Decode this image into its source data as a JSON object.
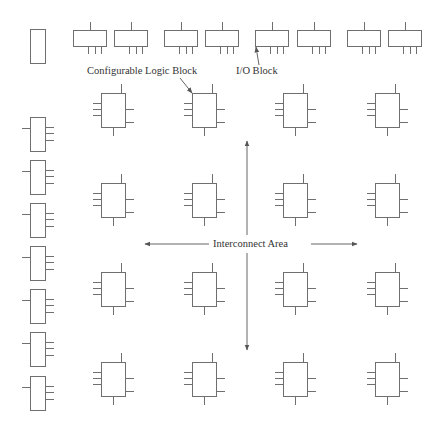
{
  "diagram": {
    "labels": {
      "clb": "Configurable Logic Block",
      "io": "I/O Block",
      "interconnect": "Interconnect Area"
    },
    "colors": {
      "stroke": "#6f6f6f",
      "text": "#333333"
    },
    "clb_grid": {
      "rows": 4,
      "cols": 4,
      "col_x": [
        101,
        192,
        283,
        375
      ],
      "row_y": [
        93,
        183,
        272,
        362
      ]
    },
    "top_io_blocks_x": [
      73,
      114,
      164,
      205,
      255,
      297,
      347,
      388
    ],
    "left_io_blocks_y": [
      117,
      160,
      203,
      246,
      289,
      332,
      376
    ]
  }
}
